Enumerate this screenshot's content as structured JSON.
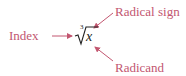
{
  "diagram": {
    "expression": {
      "index": "3",
      "radicand": "x",
      "radical_symbol": "√"
    },
    "labels": {
      "index": "Index",
      "radical_sign": "Radical sign",
      "radicand": "Radicand"
    },
    "colors": {
      "label": "#c25670",
      "expression": "#222222",
      "background": "#ffffff"
    }
  }
}
